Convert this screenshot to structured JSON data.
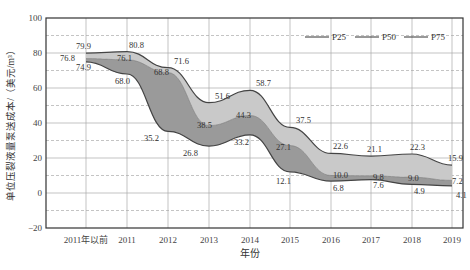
{
  "chart_data": {
    "type": "area",
    "title": "",
    "xlabel": "年份",
    "ylabel": "单位压裂液量泵送成本/（美元/m³）",
    "ylim": [
      -20,
      100
    ],
    "yticks": [
      -20,
      0,
      20,
      40,
      60,
      80,
      100
    ],
    "grid": true,
    "legend_position": "top-right",
    "categories": [
      "2011年以前",
      "2011",
      "2012",
      "2013",
      "2014",
      "2015",
      "2016",
      "2017",
      "2018",
      "2019"
    ],
    "series": [
      {
        "name": "P25",
        "values": [
          74.9,
          68.0,
          35.2,
          26.8,
          33.2,
          12.1,
          6.8,
          7.6,
          4.9,
          4.1
        ]
      },
      {
        "name": "P50",
        "values": [
          76.8,
          76.1,
          68.8,
          38.5,
          44.3,
          27.1,
          10.0,
          9.8,
          9.0,
          7.2
        ]
      },
      {
        "name": "P75",
        "values": [
          79.9,
          80.8,
          71.6,
          51.6,
          58.7,
          37.5,
          22.6,
          21.1,
          22.3,
          15.9
        ]
      }
    ],
    "colors": {
      "upper_band": "#c9c9c9",
      "lower_band": "#9a9a9a",
      "line": "#444444",
      "grid": "#aaaaaa"
    }
  }
}
